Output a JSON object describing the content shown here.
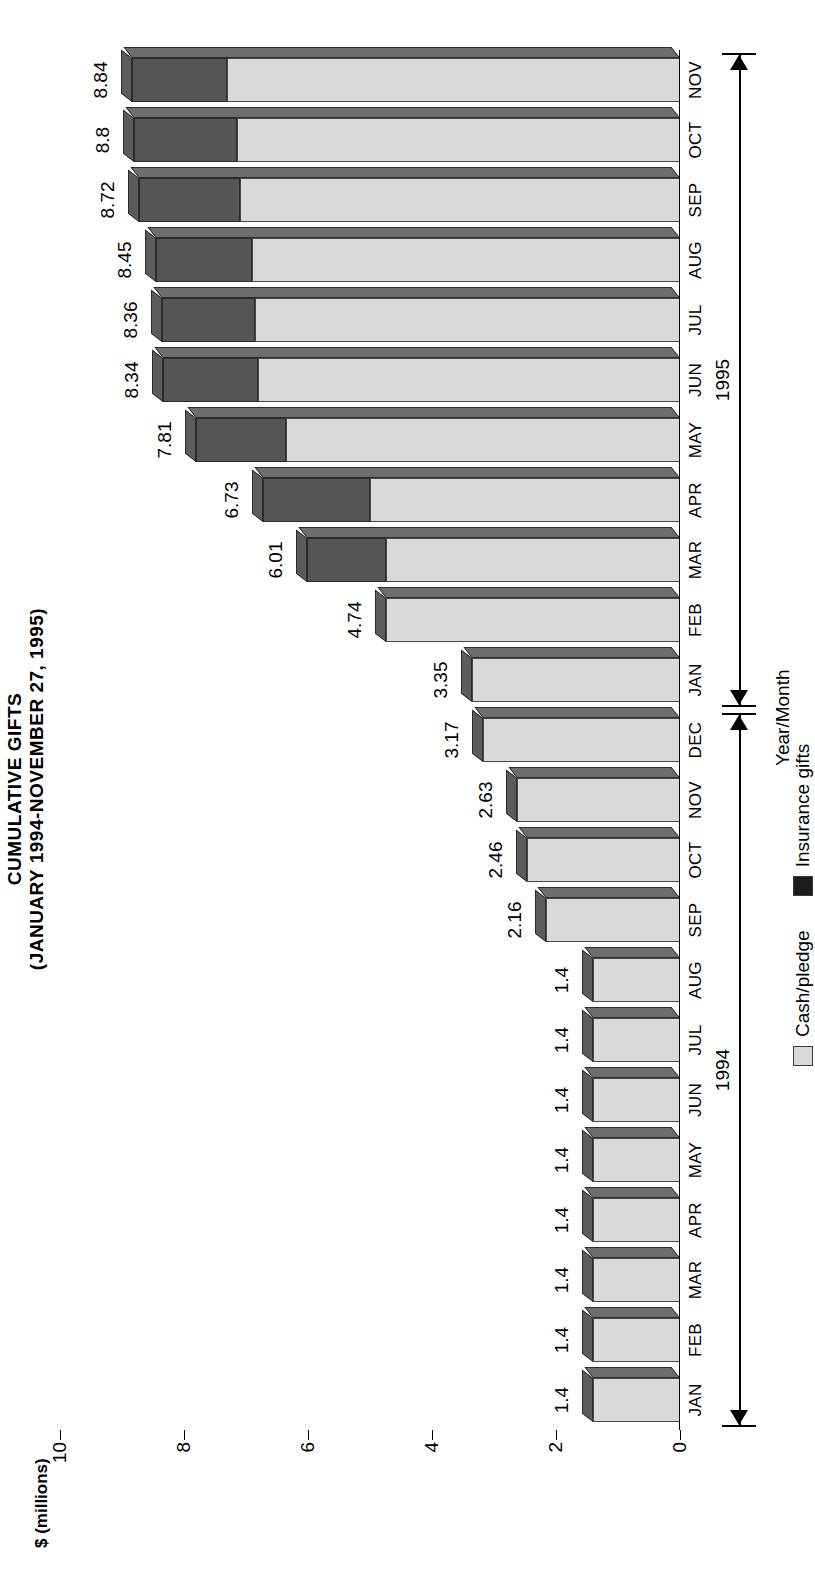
{
  "title": {
    "line1": "CUMULATIVE GIFTS",
    "line2": "(JANUARY 1994-NOVEMBER 27, 1995)"
  },
  "legend": {
    "position": "upper-left",
    "items": [
      {
        "label": "Cash/pledge",
        "swatch": "cash",
        "color": "#d9d9d9"
      },
      {
        "label": "Insurance gifts",
        "swatch": "ins",
        "color": "#1c1c1c"
      }
    ]
  },
  "axes": {
    "value_axis_name": "$ (millions)",
    "category_axis_name": "Year/Month",
    "value_ticks": [
      0,
      2,
      4,
      6,
      8,
      10
    ],
    "value_min": 0,
    "value_max": 10
  },
  "year_brackets": [
    {
      "label": "1994",
      "start_index": 0,
      "end_index": 11
    },
    {
      "label": "1995",
      "start_index": 12,
      "end_index": 22
    }
  ],
  "chart_data": {
    "type": "bar",
    "orientation": "horizontal-3d-stacked",
    "title": "CUMULATIVE GIFTS (JANUARY 1994-NOVEMBER 27, 1995)",
    "xlabel": "Year/Month",
    "ylabel": "$ (millions)",
    "ylim": [
      0,
      10
    ],
    "yticks": [
      0,
      2,
      4,
      6,
      8,
      10
    ],
    "grid": false,
    "legend_position": "upper-left",
    "categories": [
      "JAN",
      "FEB",
      "MAR",
      "APR",
      "MAY",
      "JUN",
      "JUL",
      "AUG",
      "SEP",
      "OCT",
      "NOV",
      "DEC",
      "JAN",
      "FEB",
      "MAR",
      "APR",
      "MAY",
      "JUN",
      "JUL",
      "AUG",
      "SEP",
      "OCT",
      "NOV"
    ],
    "category_years": [
      "1994",
      "1994",
      "1994",
      "1994",
      "1994",
      "1994",
      "1994",
      "1994",
      "1994",
      "1994",
      "1994",
      "1994",
      "1995",
      "1995",
      "1995",
      "1995",
      "1995",
      "1995",
      "1995",
      "1995",
      "1995",
      "1995",
      "1995"
    ],
    "totals": [
      1.4,
      1.4,
      1.4,
      1.4,
      1.4,
      1.4,
      1.4,
      1.4,
      2.16,
      2.46,
      2.63,
      3.17,
      3.35,
      4.74,
      6.01,
      6.73,
      7.81,
      8.34,
      8.36,
      8.45,
      8.72,
      8.8,
      8.84
    ],
    "data_labels": [
      "1.4",
      "1.4",
      "1.4",
      "1.4",
      "1.4",
      "1.4",
      "1.4",
      "1.4",
      "2.16",
      "2.46",
      "2.63",
      "3.17",
      "3.35",
      "4.74",
      "6.01",
      "6.73",
      "7.81",
      "8.34",
      "8.36",
      "8.45",
      "8.72",
      "8.8",
      "8.84"
    ],
    "series": [
      {
        "name": "Cash/pledge",
        "color": "#d9d9d9",
        "values": [
          1.4,
          1.4,
          1.4,
          1.4,
          1.4,
          1.4,
          1.4,
          1.4,
          2.16,
          2.46,
          2.63,
          3.17,
          3.35,
          4.74,
          4.75,
          5.0,
          6.35,
          6.8,
          6.85,
          6.9,
          7.1,
          7.15,
          7.3
        ]
      },
      {
        "name": "Insurance gifts",
        "color": "#555555",
        "values": [
          0,
          0,
          0,
          0,
          0,
          0,
          0,
          0,
          0,
          0,
          0,
          0,
          0,
          0,
          1.26,
          1.73,
          1.46,
          1.54,
          1.51,
          1.55,
          1.62,
          1.65,
          1.54
        ]
      }
    ]
  }
}
